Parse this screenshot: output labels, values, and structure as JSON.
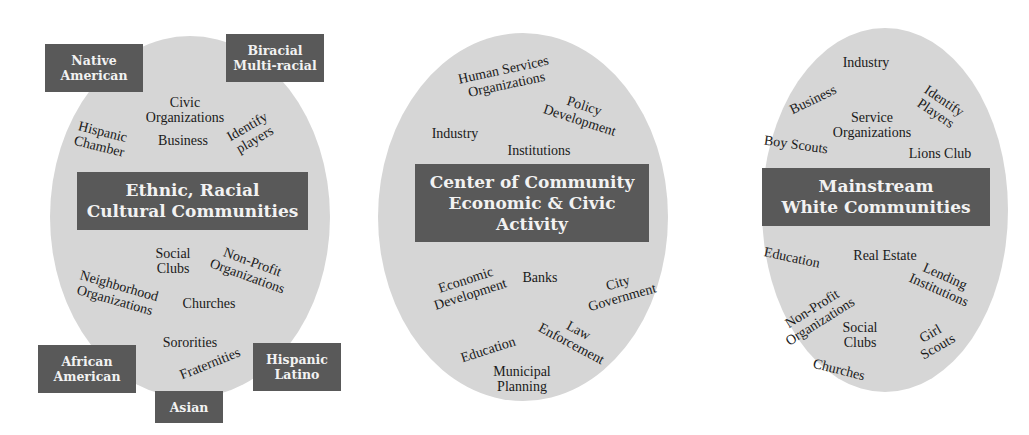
{
  "colors": {
    "ellipse_fill": "#d6d6d6",
    "box_fill": "#595959",
    "box_text": "#f2f2f2",
    "label_text": "#1a1a1a"
  },
  "left": {
    "title": "Ethnic, Racial\nCultural Communities",
    "groups": [
      {
        "label": "Native\nAmerican"
      },
      {
        "label": "Biracial\nMulti-racial"
      },
      {
        "label": "African\nAmerican"
      },
      {
        "label": "Asian"
      },
      {
        "label": "Hispanic\nLatino"
      }
    ],
    "labels": [
      "Civic\nOrganizations",
      "Business",
      "Hispanic\nChamber",
      "Identify\nplayers",
      "Social\nClubs",
      "Non-Profit\nOrganizations",
      "Neighborhood\nOrganizations",
      "Churches",
      "Sororities",
      "Fraternities"
    ]
  },
  "center": {
    "title": "Center of Community\nEconomic & Civic\nActivity",
    "labels": [
      "Human Services\nOrganizations",
      "Policy\nDevelopment",
      "Industry",
      "Institutions",
      "Economic\nDevelopment",
      "Banks",
      "City\nGovernment",
      "Law\nEnforcement",
      "Education",
      "Municipal\nPlanning"
    ]
  },
  "right": {
    "title": "Mainstream\nWhite Communities",
    "labels": [
      "Industry",
      "Business",
      "Identify\nPlayers",
      "Service\nOrganizations",
      "Boy Scouts",
      "Lions Club",
      "Education",
      "Real Estate",
      "Lending\nInstitutions",
      "Non-Profit\nOrganizations",
      "Social\nClubs",
      "Girl\nScouts",
      "Churches"
    ]
  }
}
